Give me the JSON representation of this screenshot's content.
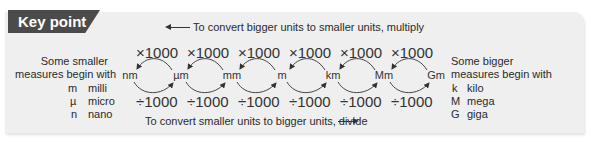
{
  "badge": {
    "label": "Key point"
  },
  "top_note": {
    "text": "To convert bigger units to smaller units, multiply",
    "arrow_direction": "left"
  },
  "bottom_note": {
    "text": "To convert smaller units to bigger units, divide",
    "arrow_direction": "right"
  },
  "units": [
    "nm",
    "µm",
    "mm",
    "m",
    "km",
    "Mm",
    "Gm"
  ],
  "multiply_labels": [
    "×1000",
    "×1000",
    "×1000",
    "×1000",
    "×1000",
    "×1000"
  ],
  "divide_labels": [
    "÷1000",
    "÷1000",
    "÷1000",
    "÷1000",
    "÷1000",
    "÷1000"
  ],
  "left_block": {
    "line1": "Some smaller",
    "line2": "measures begin with",
    "prefixes": [
      {
        "symbol": "m",
        "name": "milli"
      },
      {
        "symbol": "µ",
        "name": "micro"
      },
      {
        "symbol": "n",
        "name": "nano"
      }
    ]
  },
  "right_block": {
    "line1": "Some bigger",
    "line2": "measures begin with",
    "prefixes": [
      {
        "symbol": "k",
        "name": "kilo"
      },
      {
        "symbol": "M",
        "name": "mega"
      },
      {
        "symbol": "G",
        "name": "giga"
      }
    ]
  },
  "colors": {
    "panel": "#efefef",
    "badge": "#4b4b4b",
    "text": "#2a2a2a"
  }
}
